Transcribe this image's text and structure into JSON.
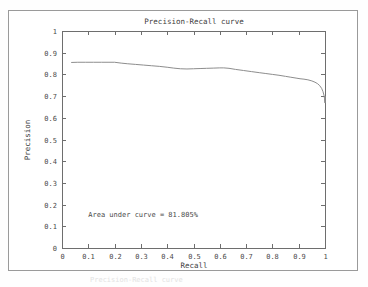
{
  "figure": {
    "title": "Precision-Recall curve",
    "annotation": "Area under curve = 81.805%",
    "caption_ghost": "Precision-Recall curve",
    "line_color": "#8d8d8d",
    "axis_color": "#6e6e6e",
    "frame_color": "#9a9a9a",
    "background": "#ffffff"
  },
  "chart_data": {
    "type": "line",
    "title": "Precision-Recall curve",
    "xlabel": "Recall",
    "ylabel": "Precision",
    "xlim": [
      0,
      1
    ],
    "ylim": [
      0,
      1
    ],
    "grid": false,
    "legend": null,
    "annotations": [
      {
        "text": "Area under curve = 81.805%",
        "x": 0.1,
        "y": 0.145
      }
    ],
    "xticks": [
      0,
      0.1,
      0.2,
      0.3,
      0.4,
      0.5,
      0.6,
      0.7,
      0.8,
      0.9,
      1
    ],
    "xtick_labels": [
      "0",
      "0.1",
      "0.2",
      "0.3",
      "0.4",
      "0.5",
      "0.6",
      "0.7",
      "0.8",
      "0.9",
      "1"
    ],
    "yticks": [
      0,
      0.1,
      0.2,
      0.3,
      0.4,
      0.5,
      0.6,
      0.7,
      0.8,
      0.9,
      1
    ],
    "ytick_labels": [
      "0",
      "0.1",
      "0.2",
      "0.3",
      "0.4",
      "0.5",
      "0.6",
      "0.7",
      "0.8",
      "0.9",
      "1"
    ],
    "series": [
      {
        "name": "precision-recall",
        "x": [
          0.035,
          0.06,
          0.09,
          0.12,
          0.15,
          0.175,
          0.2,
          0.225,
          0.25,
          0.28,
          0.31,
          0.34,
          0.37,
          0.4,
          0.425,
          0.45,
          0.475,
          0.5,
          0.525,
          0.55,
          0.575,
          0.6,
          0.615,
          0.635,
          0.66,
          0.69,
          0.72,
          0.75,
          0.775,
          0.8,
          0.825,
          0.85,
          0.87,
          0.89,
          0.905,
          0.92,
          0.935,
          0.95,
          0.962,
          0.972,
          0.98,
          0.987,
          0.992,
          0.996,
          0.998,
          1.0,
          1.0,
          1.0
        ],
        "y": [
          0.855,
          0.856,
          0.856,
          0.856,
          0.856,
          0.856,
          0.856,
          0.852,
          0.849,
          0.846,
          0.843,
          0.84,
          0.837,
          0.833,
          0.829,
          0.826,
          0.825,
          0.826,
          0.827,
          0.828,
          0.829,
          0.83,
          0.83,
          0.828,
          0.823,
          0.818,
          0.813,
          0.808,
          0.804,
          0.8,
          0.796,
          0.791,
          0.787,
          0.783,
          0.78,
          0.778,
          0.775,
          0.77,
          0.764,
          0.757,
          0.748,
          0.736,
          0.722,
          0.705,
          0.69,
          0.668,
          0.7,
          0.675
        ]
      }
    ]
  },
  "axes_geometry": {
    "plot_left": 62,
    "plot_right": 325,
    "plot_top": 31,
    "plot_bottom": 248
  }
}
